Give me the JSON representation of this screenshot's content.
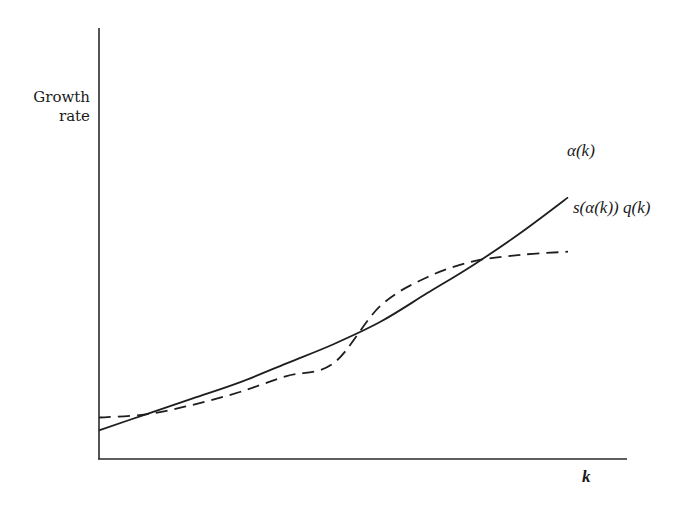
{
  "chart_data": {
    "type": "line",
    "title": "",
    "xlabel": "k",
    "ylabel": "Growth rate",
    "grid": false,
    "ticks": false,
    "legend": "inline labels at right end of curves",
    "x": [
      0,
      0.1,
      0.2,
      0.3,
      0.4,
      0.5,
      0.6,
      0.7,
      0.8,
      0.9,
      1.0
    ],
    "series": [
      {
        "name": "α(k)",
        "style": "solid",
        "values": [
          0.09,
          0.14,
          0.19,
          0.24,
          0.3,
          0.36,
          0.43,
          0.52,
          0.61,
          0.71,
          0.82
        ]
      },
      {
        "name": "s(α(k)) q(k)",
        "style": "dashed",
        "values": [
          0.13,
          0.14,
          0.17,
          0.21,
          0.26,
          0.3,
          0.48,
          0.57,
          0.62,
          0.64,
          0.65
        ]
      }
    ],
    "intersections": [
      {
        "x": 0.14,
        "y": 0.15
      },
      {
        "x": 0.49,
        "y": 0.34
      },
      {
        "x": 0.73,
        "y": 0.55
      }
    ],
    "annotations": [
      "α(k)",
      "s(α(k)) q(k)",
      "k"
    ],
    "axis_range": {
      "x": [
        0,
        1.0
      ],
      "y": [
        0,
        1.0
      ]
    }
  },
  "labels": {
    "ylabel_line1": "Growth",
    "ylabel_line2": "rate",
    "xlabel": "k",
    "series_alpha": "α(k)",
    "series_sq": "s(α(k)) q(k)"
  },
  "colors": {
    "ink": "#1e1e1e",
    "background": "#ffffff"
  }
}
